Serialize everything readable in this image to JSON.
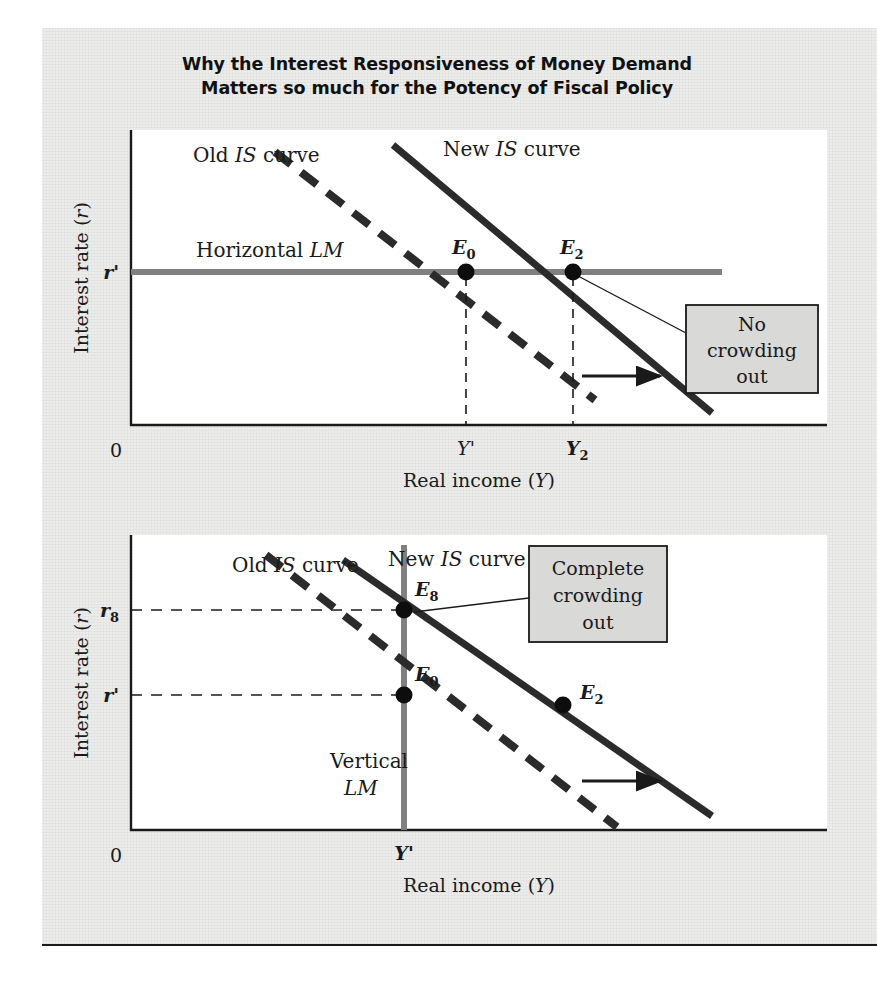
{
  "figure": {
    "title_lines": [
      "Why the Interest Responsiveness of Money Demand",
      "Matters so much for the Potency of Fiscal Policy"
    ],
    "background_color": "#dededd",
    "plot_background_color": "#ffffff",
    "lm_color": "#808080",
    "is_color": "#2b2b2b",
    "callout_fill": "#d9d9d8"
  },
  "panels": [
    {
      "id": "top-panel",
      "axes": {
        "y_title": "Interest rate (r)",
        "y_title_paren_italic": "r",
        "x_title": "Real income (Y)",
        "x_title_paren_italic": "Y",
        "origin_label": "0",
        "y_ticks": [
          {
            "label": "r",
            "sub": "",
            "prime": "'",
            "bold": true
          }
        ],
        "x_ticks": [
          {
            "label": "Y",
            "sub": "",
            "prime": "'",
            "bold": false
          },
          {
            "label": "Y",
            "sub": "2",
            "prime": "",
            "bold": true
          }
        ]
      },
      "curves": [
        {
          "name": "old-is-curve",
          "label_plain_1": "Old ",
          "label_italic": "IS",
          "label_plain_2": " curve",
          "style": "dashed"
        },
        {
          "name": "new-is-curve",
          "label_plain_1": "New ",
          "label_italic": "IS",
          "label_plain_2": " curve",
          "style": "solid"
        },
        {
          "name": "lm-curve",
          "label_plain_1": "Horizontal ",
          "label_italic": "LM",
          "label_plain_2": "",
          "style": "horizontal"
        }
      ],
      "points": [
        {
          "name": "equilibrium-e0",
          "label": "E",
          "sub": "0"
        },
        {
          "name": "equilibrium-e2",
          "label": "E",
          "sub": "2"
        }
      ],
      "callout": {
        "name": "no-crowding-out-callout",
        "lines": [
          "No",
          "crowding",
          "out"
        ]
      },
      "shift_arrow_label": ""
    },
    {
      "id": "bottom-panel",
      "axes": {
        "y_title": "Interest rate (r)",
        "y_title_paren_italic": "r",
        "x_title": "Real income (Y)",
        "x_title_paren_italic": "Y",
        "origin_label": "0",
        "y_ticks": [
          {
            "label": "r",
            "sub": "8",
            "prime": "",
            "bold": true
          },
          {
            "label": "r",
            "sub": "",
            "prime": "'",
            "bold": true
          }
        ],
        "x_ticks": [
          {
            "label": "Y",
            "sub": "",
            "prime": "'",
            "bold": true
          }
        ]
      },
      "curves": [
        {
          "name": "old-is-curve",
          "label_plain_1": "Old ",
          "label_italic": "IS",
          "label_plain_2": " curve",
          "style": "dashed"
        },
        {
          "name": "new-is-curve",
          "label_plain_1": "New ",
          "label_italic": "IS",
          "label_plain_2": " curve",
          "style": "solid"
        },
        {
          "name": "lm-curve",
          "label_plain_1": "Vertical",
          "label_italic": "LM",
          "label_plain_2": "",
          "style": "vertical"
        }
      ],
      "points": [
        {
          "name": "equilibrium-e8",
          "label": "E",
          "sub": "8"
        },
        {
          "name": "equilibrium-e0",
          "label": "E",
          "sub": "0"
        },
        {
          "name": "equilibrium-e2",
          "label": "E",
          "sub": "2"
        }
      ],
      "callout": {
        "name": "complete-crowding-out-callout",
        "lines": [
          "Complete",
          "crowding",
          "out"
        ]
      },
      "shift_arrow_label": ""
    }
  ]
}
